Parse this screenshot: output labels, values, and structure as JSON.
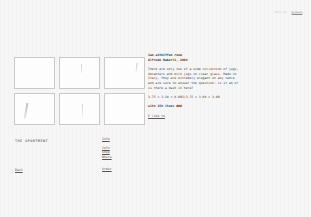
{
  "topbar": {
    "lead": "more by",
    "link": "Artist"
  },
  "grid": {
    "thumbs": [
      {
        "alt": "thumbnail-1"
      },
      {
        "alt": "thumbnail-2"
      },
      {
        "alt": "thumbnail-3"
      },
      {
        "alt": "thumbnail-4"
      },
      {
        "alt": "thumbnail-5"
      },
      {
        "alt": "thumbnail-6"
      }
    ]
  },
  "info": {
    "title": "Jan witkiffen room",
    "subtitle": "Alfredo Haberli, 2004",
    "body": "There are only two of a wide collection of jugs, decanters and milk jugs in clear glass. Made in Italy, they are extremely elegant on any table and are sure to answer the question: is it an or is there a dash in here?",
    "dimensions": "3.75 x 3.10 x 0.085/3.75 x 3.60 x 3.08",
    "edition": "with 150 items ###",
    "more_label": "E like to"
  },
  "bottom": {
    "apartment_label": "THE APARTMENT",
    "back_label": "Back",
    "nav_top": "Info",
    "nav_items": [
      "Info",
      "Shop",
      "Where"
    ],
    "nav_last": "Order"
  }
}
